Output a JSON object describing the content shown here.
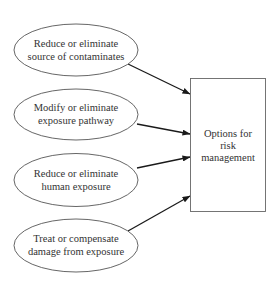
{
  "diagram": {
    "type": "flow",
    "sources": [
      {
        "id": "source",
        "lines": [
          "Reduce or eliminate",
          "source of contaminates"
        ],
        "cx": 76,
        "cy": 50
      },
      {
        "id": "pathway",
        "lines": [
          "Modify or eliminate",
          "exposure pathway"
        ],
        "cx": 76,
        "cy": 114
      },
      {
        "id": "human",
        "lines": [
          "Reduce or eliminate",
          "human exposure"
        ],
        "cx": 76,
        "cy": 180
      },
      {
        "id": "damage",
        "lines": [
          "Treat or compensate",
          "damage from exposure"
        ],
        "cx": 76,
        "cy": 245
      }
    ],
    "target": {
      "id": "options",
      "lines": [
        "Options for",
        "risk",
        "management"
      ]
    },
    "edges": [
      {
        "from": "source",
        "to": "options"
      },
      {
        "from": "pathway",
        "to": "options"
      },
      {
        "from": "human",
        "to": "options"
      },
      {
        "from": "damage",
        "to": "options"
      }
    ],
    "colors": {
      "stroke": "#555555",
      "arrow": "#1a1a1a",
      "text": "#333333",
      "background": "#ffffff"
    }
  }
}
